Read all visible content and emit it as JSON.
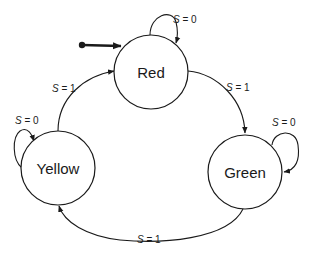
{
  "diagram": {
    "type": "finite-state-machine",
    "states": [
      {
        "id": "red",
        "label": "Red",
        "initial": true
      },
      {
        "id": "yellow",
        "label": "Yellow",
        "initial": false
      },
      {
        "id": "green",
        "label": "Green",
        "initial": false
      }
    ],
    "transitions": [
      {
        "from": "red",
        "to": "red",
        "var": "S",
        "eq": " = ",
        "value": "0"
      },
      {
        "from": "red",
        "to": "green",
        "var": "S",
        "eq": " = ",
        "value": "1"
      },
      {
        "from": "green",
        "to": "green",
        "var": "S",
        "eq": " = ",
        "value": "0"
      },
      {
        "from": "green",
        "to": "yellow",
        "var": "S",
        "eq": " = ",
        "value": "1"
      },
      {
        "from": "yellow",
        "to": "yellow",
        "var": "S",
        "eq": " = ",
        "value": "0"
      },
      {
        "from": "yellow",
        "to": "red",
        "var": "S",
        "eq": " = ",
        "value": "1"
      }
    ]
  }
}
